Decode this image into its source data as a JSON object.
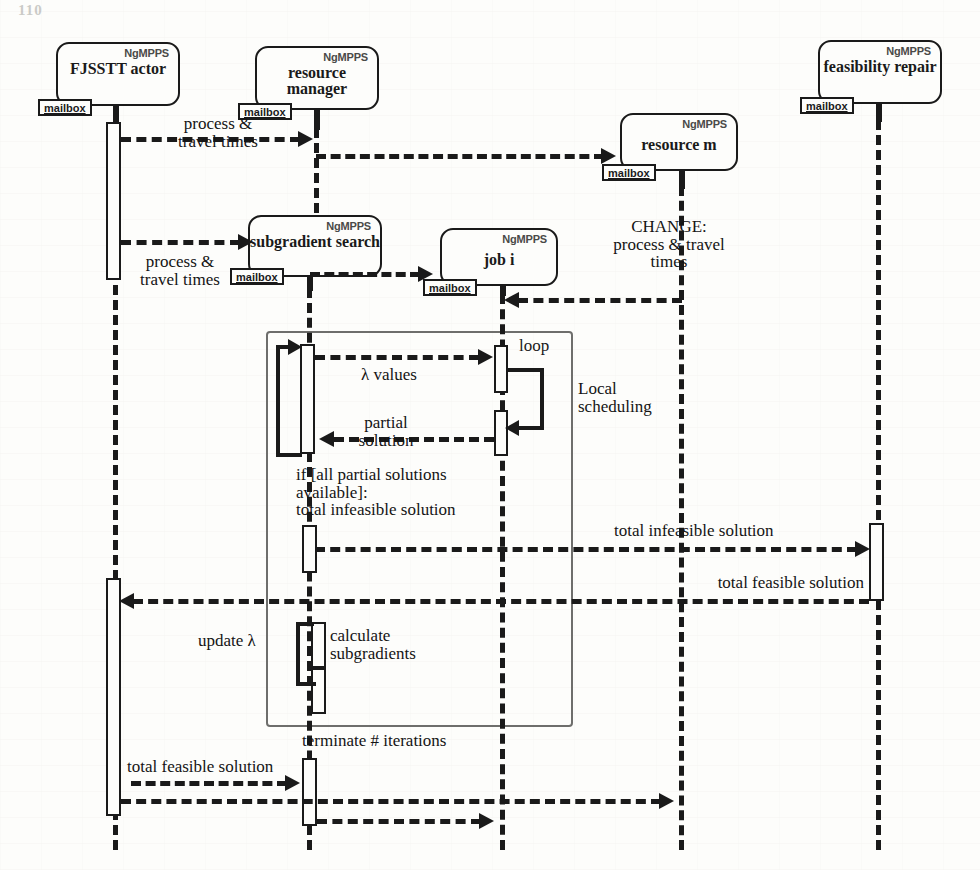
{
  "document": {
    "kind": "uml-sequence-diagram",
    "folio": "110",
    "stereotype": "NgMPPS",
    "mailbox_label": "mailbox"
  },
  "lifelines": [
    {
      "id": "fjsstt",
      "name": "FJSSTT\nactor",
      "stereotype": "NgMPPS",
      "mailbox": "mailbox"
    },
    {
      "id": "resmanager",
      "name": "resource\nmanager",
      "stereotype": "NgMPPS",
      "mailbox": "mailbox"
    },
    {
      "id": "subgradient",
      "name": "subgradient\nsearch",
      "stereotype": "NgMPPS",
      "mailbox": "mailbox"
    },
    {
      "id": "jobi",
      "name": "job i",
      "stereotype": "NgMPPS",
      "mailbox": "mailbox"
    },
    {
      "id": "resourcem",
      "name": "resource m",
      "stereotype": "NgMPPS",
      "mailbox": "mailbox"
    },
    {
      "id": "feasibility",
      "name": "feasibility\nrepair",
      "stereotype": "NgMPPS",
      "mailbox": "mailbox"
    }
  ],
  "messages": [
    {
      "id": "m1",
      "label": "process &\ntravel times",
      "from": "fjsstt",
      "to": "resmanager",
      "direction": "right"
    },
    {
      "id": "m2",
      "label": "",
      "from": "resmanager",
      "to": "resourcem",
      "direction": "right"
    },
    {
      "id": "m3",
      "label": "process &\ntravel times",
      "from": "fjsstt",
      "to": "subgradient",
      "direction": "right"
    },
    {
      "id": "m4",
      "label": "",
      "from": "subgradient",
      "to": "jobi",
      "direction": "right"
    },
    {
      "id": "m5",
      "label": "CHANGE:\nprocess & travel\ntimes",
      "from": "resourcem",
      "to": "jobi",
      "direction": "left"
    },
    {
      "id": "m6",
      "label": "λ values",
      "from": "subgradient",
      "to": "jobi",
      "direction": "right"
    },
    {
      "id": "m7",
      "label": "Local\nscheduling",
      "from": "jobi",
      "to": "jobi",
      "direction": "self"
    },
    {
      "id": "m8",
      "label": "partial\nsolution",
      "from": "jobi",
      "to": "subgradient",
      "direction": "left"
    },
    {
      "id": "m9",
      "label": "if [all partial solutions\navailable]:\ntotal infeasible solution",
      "from": "subgradient",
      "to": "feasibility",
      "direction": "right"
    },
    {
      "id": "m10",
      "label": "total infeasible solution",
      "from": "subgradient",
      "to": "feasibility",
      "direction": "right"
    },
    {
      "id": "m11",
      "label": "total feasible solution",
      "from": "feasibility",
      "to": "fjsstt",
      "direction": "left"
    },
    {
      "id": "m12",
      "label": "update λ",
      "from": "subgradient",
      "to": "subgradient",
      "direction": "self"
    },
    {
      "id": "m13",
      "label": "calculate\nsubgradients",
      "from": "subgradient",
      "to": "subgradient",
      "direction": "self"
    },
    {
      "id": "m14",
      "label": "terminate # iterations",
      "from": "subgradient",
      "to": "subgradient",
      "direction": "note"
    },
    {
      "id": "m15",
      "label": "total feasible solution",
      "from": "fjsstt",
      "to": "subgradient",
      "direction": "right"
    },
    {
      "id": "m16",
      "label": "",
      "from": "fjsstt",
      "to": "resourcem",
      "direction": "right"
    },
    {
      "id": "m17",
      "label": "",
      "from": "subgradient",
      "to": "resourcem",
      "direction": "right"
    }
  ],
  "fragments": [
    {
      "id": "loop",
      "label": "loop"
    }
  ],
  "labels": {
    "process_travel_1": "process &\ntravel times",
    "process_travel_2": "process &\ntravel times",
    "change_process_travel": "CHANGE:\nprocess & travel\ntimes",
    "lambda_values": "λ values",
    "loop": "loop",
    "local_scheduling": "Local\nscheduling",
    "partial_solution": "partial\nsolution",
    "if_condition": "if [all partial solutions\navailable]:\ntotal infeasible solution",
    "total_infeasible_solution": "total infeasible solution",
    "total_feasible_solution_right": "total feasible solution",
    "update_lambda": "update λ",
    "calculate_subgradients": "calculate\nsubgradients",
    "terminate_iterations": "terminate # iterations",
    "total_feasible_solution_bottom": "total feasible solution"
  },
  "colors": {
    "ink": "#1a1a1a",
    "paper": "#fdfdfb",
    "fragment_border": "#6e6e6c",
    "stereotype_ink": "#4a4a48"
  }
}
